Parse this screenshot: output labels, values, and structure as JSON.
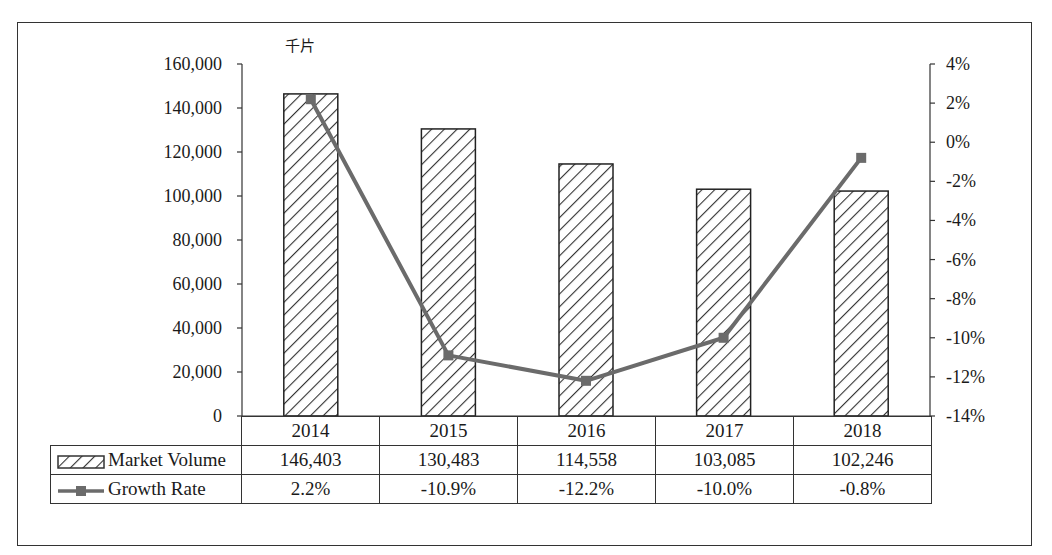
{
  "chart_data": {
    "type": "bar+line",
    "title": "",
    "unit_label": "千片",
    "categories": [
      "2014",
      "2015",
      "2016",
      "2017",
      "2018"
    ],
    "series": [
      {
        "name": "Market Volume",
        "type": "bar",
        "axis": "left",
        "values": [
          146403,
          130483,
          114558,
          103085,
          102246
        ],
        "display": [
          "146,403",
          "130,483",
          "114,558",
          "103,085",
          "102,246"
        ]
      },
      {
        "name": "Growth Rate",
        "type": "line",
        "axis": "right",
        "values": [
          2.2,
          -10.9,
          -12.2,
          -10.0,
          -0.8
        ],
        "display": [
          "2.2%",
          "-10.9%",
          "-12.2%",
          "-10.0%",
          "-0.8%"
        ]
      }
    ],
    "left_axis": {
      "min": 0,
      "max": 160000,
      "step": 20000,
      "ticks": [
        "0",
        "20,000",
        "40,000",
        "60,000",
        "80,000",
        "100,000",
        "120,000",
        "140,000",
        "160,000"
      ]
    },
    "right_axis": {
      "min": -14,
      "max": 4,
      "step": 2,
      "ticks": [
        "-14%",
        "-12%",
        "-10%",
        "-8%",
        "-6%",
        "-4%",
        "-2%",
        "0%",
        "2%",
        "4%"
      ]
    },
    "grid": false,
    "legend_position": "data-table",
    "colors": {
      "bar_hatch": "#333333",
      "line": "#6b6b6b",
      "marker": "#6b6b6b",
      "border": "#333333"
    }
  }
}
